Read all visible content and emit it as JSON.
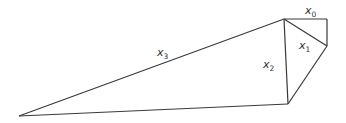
{
  "diagram": {
    "type": "geometric-figure",
    "stroke_color": "#3a3a3a",
    "vertices": {
      "A": [
        19,
        116
      ],
      "B": [
        284,
        19
      ],
      "C": [
        327,
        19
      ],
      "D": [
        327,
        46
      ],
      "E": [
        288,
        104
      ]
    },
    "labels": [
      {
        "id": "x0",
        "base": "x",
        "sub": "0",
        "pos": [
          305,
          14
        ]
      },
      {
        "id": "x1",
        "base": "x",
        "sub": "1",
        "pos": [
          299,
          49
        ]
      },
      {
        "id": "x2",
        "base": "x",
        "sub": "2",
        "pos": [
          263,
          68
        ]
      },
      {
        "id": "x3",
        "base": "x",
        "sub": "3",
        "pos": [
          157,
          56
        ]
      }
    ]
  }
}
